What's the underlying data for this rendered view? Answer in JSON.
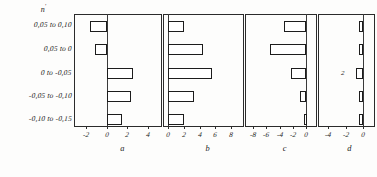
{
  "figure": {
    "column_header": "n",
    "column_header_sup": "'",
    "row_labels": [
      "0,05 to 0,10",
      "0,05 to 0",
      "0 to -0,05",
      "-0,05 to -0,10",
      "-0,10 to -0,15"
    ],
    "panel_captions": [
      "a",
      "b",
      "c",
      "d"
    ],
    "note_d": "2"
  },
  "chart_data": [
    {
      "type": "bar",
      "title": "a",
      "orientation": "horizontal",
      "categories": [
        "0,05 to 0,10",
        "0,05 to 0",
        "0 to -0,05",
        "-0,05 to -0,10",
        "-0,10 to -0,15"
      ],
      "values": [
        -1.6,
        -1.1,
        2.6,
        2.4,
        1.5
      ],
      "xlim": [
        -3.2,
        5.4
      ],
      "ticks": [
        -2,
        0,
        2,
        4
      ],
      "ticklabels": [
        "-2",
        "0",
        "2",
        "4"
      ],
      "xlabel": "",
      "ylabel": "n'",
      "grid": false,
      "legend": false
    },
    {
      "type": "bar",
      "title": "b",
      "orientation": "horizontal",
      "categories": [
        "0,05 to 0,10",
        "0,05 to 0",
        "0 to -0,05",
        "-0,05 to -0,10",
        "-0,10 to -0,15"
      ],
      "values": [
        2.1,
        4.5,
        5.6,
        3.3,
        2.1
      ],
      "xlim": [
        -0.6,
        9.6
      ],
      "ticks": [
        0,
        2,
        4,
        6,
        8
      ],
      "ticklabels": [
        "0",
        "2",
        "4",
        "6",
        "8"
      ],
      "xlabel": "",
      "ylabel": "",
      "grid": false,
      "legend": false
    },
    {
      "type": "bar",
      "title": "c",
      "orientation": "horizontal",
      "categories": [
        "0,05 to 0,10",
        "0,05 to 0",
        "0 to -0,05",
        "-0,05 to -0,10",
        "-0,10 to -0,15"
      ],
      "values": [
        -3.4,
        -5.4,
        -2.3,
        -0.9,
        -0.3
      ],
      "xlim": [
        -9.2,
        1.6
      ],
      "ticks": [
        -8,
        -6,
        -4,
        -2,
        0
      ],
      "ticklabels": [
        "-8",
        "-6",
        "-4",
        "-2",
        "0"
      ],
      "xlabel": "",
      "ylabel": "",
      "grid": false,
      "legend": false
    },
    {
      "type": "bar",
      "title": "d",
      "orientation": "horizontal",
      "categories": [
        "0,05 to 0,10",
        "0,05 to 0",
        "0 to -0,05",
        "-0,05 to -0,10",
        "-0,10 to -0,15"
      ],
      "values": [
        -0.45,
        -0.45,
        -0.75,
        -0.45,
        -0.45
      ],
      "xlim": [
        -5.2,
        1.4
      ],
      "ticks": [
        -4,
        -2,
        0
      ],
      "ticklabels": [
        "-4",
        "-2",
        "0"
      ],
      "xlabel": "",
      "ylabel": "",
      "grid": false,
      "legend": false,
      "annotation": "2"
    }
  ]
}
